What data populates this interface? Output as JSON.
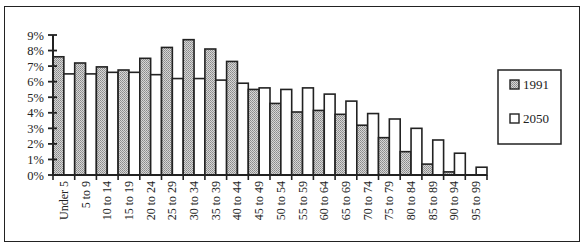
{
  "chart_data": {
    "type": "bar",
    "title": "",
    "xlabel": "",
    "ylabel": "",
    "ylim": [
      0,
      9
    ],
    "yticks": [
      "0%",
      "1%",
      "2%",
      "3%",
      "4%",
      "5%",
      "6%",
      "7%",
      "8%",
      "9%"
    ],
    "grid": false,
    "legend_position": "right",
    "categories": [
      "Under 5",
      "5 to 9",
      "10 to 14",
      "15 to 19",
      "20 to 24",
      "25 to 29",
      "30 to 34",
      "35 to 39",
      "40 to 44",
      "45 to 49",
      "50 to 54",
      "55 to 59",
      "60 to 64",
      "65 to 69",
      "70 to 74",
      "75 to 79",
      "80 to 84",
      "85 to 89",
      "90 to 94",
      "95 to 99"
    ],
    "series": [
      {
        "name": "1991",
        "fill": "pattern-gray",
        "values": [
          7.6,
          7.2,
          6.95,
          6.75,
          7.5,
          8.2,
          8.7,
          8.1,
          7.3,
          5.5,
          4.6,
          4.05,
          4.15,
          3.9,
          3.2,
          2.4,
          1.5,
          0.7,
          0.2,
          0.0
        ]
      },
      {
        "name": "2050",
        "fill": "#ffffff",
        "values": [
          6.5,
          6.5,
          6.6,
          6.6,
          6.45,
          6.2,
          6.2,
          6.1,
          5.9,
          5.6,
          5.5,
          5.6,
          5.2,
          4.75,
          3.95,
          3.6,
          3.0,
          2.25,
          1.4,
          0.5
        ]
      }
    ]
  },
  "legend": {
    "items": [
      {
        "label": "1991",
        "swatch": "pattern-gray"
      },
      {
        "label": "2050",
        "swatch": "#ffffff"
      }
    ]
  },
  "colors": {
    "stroke": "#222222",
    "bar_1991": "#bdbdbd",
    "bar_2050": "#ffffff"
  }
}
